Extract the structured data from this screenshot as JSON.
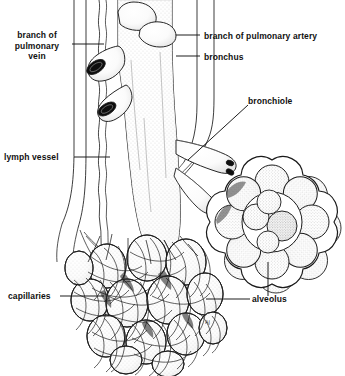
{
  "figure": {
    "background_color": "#ffffff",
    "ink_color": "#111111",
    "width": 345,
    "height": 376,
    "signature": "AJ"
  },
  "labels": {
    "pulmonary_vein": {
      "line1": "branch of",
      "line2": "pulmonary",
      "line3": "vein",
      "leader": "horizontal-right"
    },
    "pulmonary_artery": {
      "text": "branch of pulmonary artery",
      "leader": "horizontal-left"
    },
    "bronchus": {
      "text": "bronchus",
      "leader": "horizontal-left"
    },
    "bronchiole": {
      "text": "bronchiole",
      "leader": "diagonal-down-left"
    },
    "lymph_vessel": {
      "text": "lymph vessel",
      "leader": "horizontal-right"
    },
    "capillaries": {
      "text": "capillaries",
      "leader": "horizontal-right"
    },
    "alveolus": {
      "text": "alveolus",
      "leader": "horizontal-left-and-vertical-up"
    }
  },
  "structures": [
    {
      "name": "bronchus",
      "description": "large stippled airway tube running vertically down the centre with two cut branch stubs at upper left and two stubs at top"
    },
    {
      "name": "branch-of-pulmonary-vein",
      "description": "pair of straight parallel lines running vertically at left of bronchus"
    },
    {
      "name": "lymph-vessel",
      "description": "thin wavy line running vertically between vein and bronchus"
    },
    {
      "name": "branch-of-pulmonary-artery",
      "description": "vessel running vertically right of bronchus then sweeping down-left"
    },
    {
      "name": "bronchiole",
      "description": "small airway branching right off the bronchus toward the alveolar sac"
    },
    {
      "name": "alveolar-sac-cutaway",
      "description": "flower-shaped rosette of eight alveoli surrounding central stippled air spaces, upper right"
    },
    {
      "name": "alveolar-cluster",
      "description": "grape-like bunch of alveoli at lower left wrapped in capillary mesh"
    },
    {
      "name": "capillary-network",
      "description": "mesh of fine looping vessels covering the alveolar cluster"
    }
  ]
}
